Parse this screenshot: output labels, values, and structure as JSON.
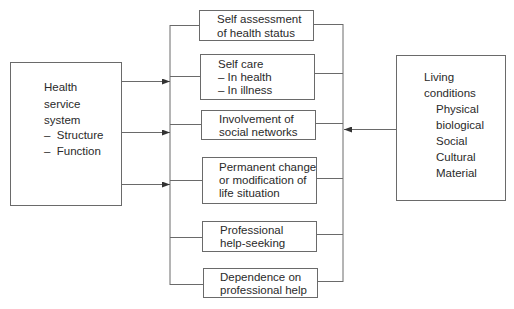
{
  "diagram": {
    "left_box": {
      "title_lines": [
        "Health",
        "service",
        "system"
      ],
      "items": [
        "–  Structure",
        "–  Function"
      ]
    },
    "right_box": {
      "title_lines": [
        "Living",
        "conditions"
      ],
      "items": [
        "Physical",
        "biological",
        "Social",
        "Cultural",
        "Material"
      ]
    },
    "center_boxes": [
      {
        "lines": [
          "Self assessment",
          "of health status"
        ]
      },
      {
        "lines": [
          "Self care",
          "– In health",
          "– In illness"
        ]
      },
      {
        "lines": [
          "Involvement of",
          "social networks"
        ]
      },
      {
        "lines": [
          "Permanent change",
          "or modification of",
          "life situation"
        ]
      },
      {
        "lines": [
          "Professional",
          "help-seeking"
        ]
      },
      {
        "lines": [
          "Dependence on",
          "professional help"
        ]
      }
    ],
    "arrows": [
      {
        "from": "Health service system",
        "to": "center-column",
        "y": 81
      },
      {
        "from": "Health service system",
        "to": "center-column",
        "y": 132
      },
      {
        "from": "Health service system",
        "to": "center-column",
        "y": 184
      },
      {
        "from": "Living conditions",
        "to": "center-column",
        "y": 130
      }
    ],
    "colors": {
      "line": "#6a6a6a",
      "text": "#2a2a2a",
      "background": "#ffffff"
    }
  }
}
